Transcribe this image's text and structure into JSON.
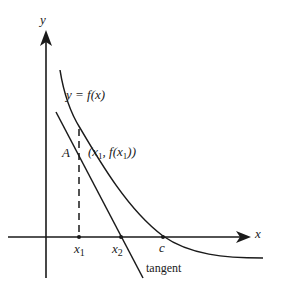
{
  "diagram": {
    "axes": {
      "x_label": "x",
      "y_label": "y"
    },
    "curve_label": "y = f(x)",
    "point_label": "A",
    "point_coords_label": "(x1, f(x1))",
    "tangent_label": "tangent",
    "x_ticks": [
      "x1",
      "x2",
      "c"
    ],
    "colors": {
      "stroke": "#1a1a1a",
      "background": "#ffffff"
    }
  }
}
